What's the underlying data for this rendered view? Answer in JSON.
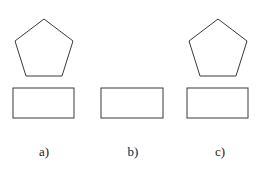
{
  "figure": {
    "panels": [
      {
        "id": "a",
        "label": "a)",
        "has_pentagon": true,
        "pentagon": "44,19 73,41 62,76 26,76 15,41",
        "rect": {
          "x": 13,
          "y": 88,
          "w": 61,
          "h": 30
        },
        "label_x": 44
      },
      {
        "id": "b",
        "label": "b)",
        "has_pentagon": false,
        "rect": {
          "x": 101,
          "y": 88,
          "w": 62,
          "h": 30
        },
        "label_x": 133
      },
      {
        "id": "c",
        "label": "c)",
        "has_pentagon": true,
        "pentagon": "218,19 247,41 236,76 200,76 189,41",
        "rect": {
          "x": 187,
          "y": 88,
          "w": 61,
          "h": 30
        },
        "label_x": 220
      }
    ],
    "label_y": 156,
    "stroke_color": "#3a3a3a",
    "background": "#ffffff"
  }
}
